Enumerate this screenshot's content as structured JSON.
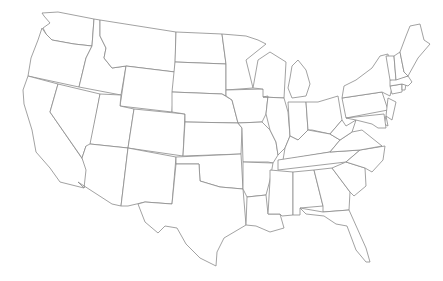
{
  "map": {
    "title": "",
    "type": "us-states-outline",
    "background": "#ffffff",
    "stroke_color": "#8a8a8a",
    "fill_color": "#ffffff",
    "states": [
      {
        "id": "WA",
        "name": "Washington",
        "points": "42,13 58,12 94,19 92,46 74,44 52,40 46,34 43,28 50,23 44,16"
      },
      {
        "id": "OR",
        "name": "Oregon",
        "points": "42,28 46,34 52,40 74,44 92,46 86,58 79,87 28,76 31,58 38,40"
      },
      {
        "id": "CA",
        "name": "California",
        "points": "28,76 58,84 50,112 90,170 84,188 60,182 50,168 36,152 32,130 24,104 23,90"
      },
      {
        "id": "ID",
        "name": "Idaho",
        "points": "94,19 100,20 100,36 106,48 104,58 112,68 126,66 121,95 79,87 86,58 92,46"
      },
      {
        "id": "NV",
        "name": "Nevada",
        "points": "58,84 100,94 90,150 86,146 82,158 50,112"
      },
      {
        "id": "MT",
        "name": "Montana",
        "points": "100,20 176,32 175,72 126,66 112,68 104,58 106,48 100,36"
      },
      {
        "id": "WY",
        "name": "Wyoming",
        "points": "126,66 175,72 172,112 120,106"
      },
      {
        "id": "UT",
        "name": "Utah",
        "points": "100,94 121,95 120,106 134,109 128,148 90,144"
      },
      {
        "id": "AZ",
        "name": "Arizona",
        "points": "90,144 128,148 121,206 112,204 78,182 84,188 86,170 82,158 86,146"
      },
      {
        "id": "CO",
        "name": "Colorado",
        "points": "134,109 185,114 183,156 128,148"
      },
      {
        "id": "NM",
        "name": "New Mexico",
        "points": "128,148 176,157 172,204 145,202 128,206 121,206"
      },
      {
        "id": "ND",
        "name": "North Dakota",
        "points": "176,32 222,34 226,64 175,62"
      },
      {
        "id": "SD",
        "name": "South Dakota",
        "points": "175,62 226,64 226,96 222,94 172,92"
      },
      {
        "id": "NE",
        "name": "Nebraska",
        "points": "172,92 222,94 232,100 238,123 185,122 185,114 172,112"
      },
      {
        "id": "KS",
        "name": "Kansas",
        "points": "185,122 238,123 242,128 241,154 183,156"
      },
      {
        "id": "OK",
        "name": "Oklahoma",
        "points": "176,157 241,154 243,189 220,187 200,181 199,164 176,164"
      },
      {
        "id": "TX",
        "name": "Texas",
        "points": "176,164 199,164 200,181 220,187 243,189 246,225 224,238 217,252 216,266 200,258 186,244 177,228 165,226 158,233 145,222 138,204 145,202 172,204"
      },
      {
        "id": "MN",
        "name": "Minnesota",
        "points": "222,34 246,36 258,40 266,44 246,60 253,88 226,90 226,64"
      },
      {
        "id": "IA",
        "name": "Iowa",
        "points": "226,90 263,89 268,96 266,114 262,122 238,123 232,100 226,96"
      },
      {
        "id": "MO",
        "name": "Missouri",
        "points": "238,123 262,122 270,130 276,142 278,155 273,163 268,162 243,162 242,128"
      },
      {
        "id": "AR",
        "name": "Arkansas",
        "points": "243,162 273,163 270,180 266,195 247,197 243,189"
      },
      {
        "id": "LA",
        "name": "Louisiana",
        "points": "247,197 266,195 268,214 280,214 284,228 270,232 256,226 246,225"
      },
      {
        "id": "WI",
        "name": "Wisconsin",
        "points": "253,88 258,60 270,52 286,62 284,98 263,97 263,89"
      },
      {
        "id": "IL",
        "name": "Illinois",
        "points": "263,97 284,98 288,112 290,136 285,148 278,155 276,142 270,130 266,114 268,96"
      },
      {
        "id": "MI",
        "name": "Michigan",
        "points": "292,66 298,60 306,70 310,84 306,96 292,98 288,88 290,78"
      },
      {
        "id": "IN",
        "name": "Indiana",
        "points": "288,102 306,102 308,130 298,140 290,136"
      },
      {
        "id": "OH",
        "name": "Ohio",
        "points": "306,102 318,102 338,96 342,120 330,134 312,130 308,130"
      },
      {
        "id": "KY",
        "name": "Kentucky",
        "points": "285,148 290,136 298,140 308,130 330,134 340,140 330,152 283,160"
      },
      {
        "id": "TN",
        "name": "Tennessee",
        "points": "278,160 330,152 360,150 346,162 278,170"
      },
      {
        "id": "MS",
        "name": "Mississippi",
        "points": "270,170 293,172 293,215 282,216 280,214 268,214 270,180"
      },
      {
        "id": "AL",
        "name": "Alabama",
        "points": "293,172 314,170 323,206 300,208 300,215 293,215"
      },
      {
        "id": "GA",
        "name": "Georgia",
        "points": "314,170 332,168 350,192 349,210 323,212 323,206"
      },
      {
        "id": "FL",
        "name": "Florida",
        "points": "300,208 323,212 349,210 366,248 370,262 366,262 356,250 347,226 336,224 324,216 306,214"
      },
      {
        "id": "SC",
        "name": "South Carolina",
        "points": "332,168 346,162 365,168 366,186 354,196 350,192"
      },
      {
        "id": "NC",
        "name": "North Carolina",
        "points": "346,162 360,150 385,146 383,160 372,172 365,168"
      },
      {
        "id": "VA",
        "name": "Virginia",
        "points": "330,152 340,140 352,132 362,130 372,138 382,146 360,150"
      },
      {
        "id": "WV",
        "name": "West Virginia",
        "points": "330,134 342,120 346,126 356,120 352,132 340,140"
      },
      {
        "id": "PA",
        "name": "Pennsylvania",
        "points": "342,98 382,92 388,110 346,118"
      },
      {
        "id": "NY",
        "name": "New York",
        "points": "344,86 356,80 372,68 380,56 388,54 392,88 390,96 382,92 342,98"
      },
      {
        "id": "NJ",
        "name": "New Jersey",
        "points": "388,98 396,102 392,120 386,116"
      },
      {
        "id": "DE",
        "name": "Delaware",
        "points": "386,116 388,126 384,124"
      },
      {
        "id": "MD",
        "name": "Maryland",
        "points": "346,118 384,114 386,128 378,128 372,124 356,120"
      },
      {
        "id": "CT",
        "name": "Connecticut",
        "points": "390,86 402,84 402,92 392,94"
      },
      {
        "id": "RI",
        "name": "Rhode Island",
        "points": "402,84 406,84 405,90 402,90"
      },
      {
        "id": "MA",
        "name": "Massachusetts",
        "points": "390,80 408,76 412,82 408,86 402,84 390,86"
      },
      {
        "id": "VT",
        "name": "Vermont",
        "points": "386,56 394,56 396,80 390,80"
      },
      {
        "id": "NH",
        "name": "New Hampshire",
        "points": "394,56 400,52 404,72 408,76 396,80"
      },
      {
        "id": "ME",
        "name": "Maine",
        "points": "400,52 406,36 410,26 420,24 424,40 430,44 418,58 408,76 404,72"
      }
    ]
  }
}
